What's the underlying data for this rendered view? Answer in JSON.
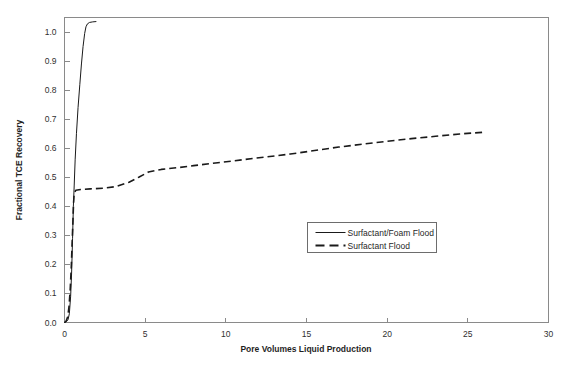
{
  "chart_data": {
    "type": "line",
    "title": "",
    "xlabel": "Pore Volumes Liquid Production",
    "ylabel": "Fractional TCE Recovery",
    "xlim": [
      0,
      30
    ],
    "ylim": [
      0.0,
      1.05
    ],
    "xticks": [
      "0",
      "5",
      "10",
      "15",
      "20",
      "25",
      "30"
    ],
    "xtick_values": [
      0,
      5,
      10,
      15,
      20,
      25,
      30
    ],
    "yticks": [
      "0.0",
      "0.1",
      "0.2",
      "0.3",
      "0.4",
      "0.5",
      "0.6",
      "0.7",
      "0.8",
      "0.9",
      "1.0"
    ],
    "ytick_values": [
      0.0,
      0.1,
      0.2,
      0.3,
      0.4,
      0.5,
      0.6,
      0.7,
      0.8,
      0.9,
      1.0
    ],
    "grid": false,
    "legend_position": "center",
    "series": [
      {
        "name": "Surfactant/Foam Flood",
        "style": "solid",
        "color": "#1a1a1a",
        "points": [
          [
            0.0,
            0.0
          ],
          [
            0.12,
            0.003
          ],
          [
            0.22,
            0.01
          ],
          [
            0.3,
            0.03
          ],
          [
            0.38,
            0.09
          ],
          [
            0.44,
            0.17
          ],
          [
            0.5,
            0.29
          ],
          [
            0.55,
            0.4
          ],
          [
            0.6,
            0.47
          ],
          [
            0.66,
            0.56
          ],
          [
            0.74,
            0.65
          ],
          [
            0.84,
            0.74
          ],
          [
            0.95,
            0.82
          ],
          [
            1.05,
            0.89
          ],
          [
            1.15,
            0.95
          ],
          [
            1.25,
            0.995
          ],
          [
            1.33,
            1.018
          ],
          [
            1.42,
            1.028
          ],
          [
            1.55,
            1.033
          ],
          [
            1.75,
            1.035
          ],
          [
            1.95,
            1.036
          ]
        ]
      },
      {
        "name": "Surfactant Flood",
        "style": "dashed",
        "color": "#1a1a1a",
        "points": [
          [
            0.0,
            0.0
          ],
          [
            0.1,
            0.005
          ],
          [
            0.2,
            0.02
          ],
          [
            0.28,
            0.055
          ],
          [
            0.35,
            0.11
          ],
          [
            0.42,
            0.19
          ],
          [
            0.47,
            0.27
          ],
          [
            0.52,
            0.345
          ],
          [
            0.56,
            0.41
          ],
          [
            0.6,
            0.445
          ],
          [
            0.7,
            0.455
          ],
          [
            1.0,
            0.458
          ],
          [
            1.6,
            0.46
          ],
          [
            2.4,
            0.462
          ],
          [
            3.2,
            0.468
          ],
          [
            4.0,
            0.483
          ],
          [
            4.6,
            0.5
          ],
          [
            5.2,
            0.518
          ],
          [
            6.0,
            0.527
          ],
          [
            7.0,
            0.533
          ],
          [
            8.0,
            0.54
          ],
          [
            9.5,
            0.55
          ],
          [
            11.0,
            0.56
          ],
          [
            12.5,
            0.57
          ],
          [
            14.0,
            0.58
          ],
          [
            15.5,
            0.592
          ],
          [
            17.0,
            0.604
          ],
          [
            18.5,
            0.614
          ],
          [
            20.0,
            0.624
          ],
          [
            21.5,
            0.633
          ],
          [
            23.0,
            0.641
          ],
          [
            24.5,
            0.649
          ],
          [
            26.0,
            0.655
          ]
        ]
      }
    ],
    "legend": [
      {
        "label": "Surfactant/Foam Flood",
        "style": "solid"
      },
      {
        "label": "Surfactant Flood",
        "style": "dashed"
      }
    ]
  }
}
